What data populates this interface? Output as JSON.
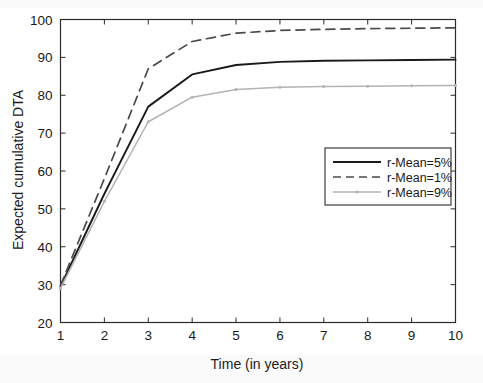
{
  "chart_data": {
    "type": "line",
    "title": "",
    "xlabel": "Time (in years)",
    "ylabel": "Expected cumulative DTA",
    "x": [
      1,
      2,
      3,
      4,
      5,
      6,
      7,
      8,
      9,
      10
    ],
    "xlim": [
      1,
      10
    ],
    "ylim": [
      20,
      100
    ],
    "xticks": [
      "1",
      "2",
      "3",
      "4",
      "5",
      "6",
      "7",
      "8",
      "9",
      "10"
    ],
    "yticks": [
      "20",
      "30",
      "40",
      "50",
      "60",
      "70",
      "80",
      "90",
      "100"
    ],
    "grid": false,
    "legend_position": "center-right",
    "series": [
      {
        "name": "r-Mean=5%",
        "style": "solid",
        "color": "#1a1a1a",
        "width": 1.9,
        "marker": "none",
        "values": [
          29.5,
          54.0,
          77.0,
          85.5,
          88.0,
          88.8,
          89.1,
          89.2,
          89.3,
          89.4
        ]
      },
      {
        "name": "r-Mean=1%",
        "style": "dashed",
        "color": "#4a4a4a",
        "width": 1.7,
        "marker": "none",
        "values": [
          29.8,
          58.0,
          87.0,
          94.2,
          96.4,
          97.1,
          97.4,
          97.6,
          97.7,
          97.8
        ]
      },
      {
        "name": "r-Mean=9%",
        "style": "solid",
        "color": "#b3b3b3",
        "width": 1.5,
        "marker": "dot",
        "values": [
          29.0,
          52.0,
          73.0,
          79.5,
          81.5,
          82.1,
          82.3,
          82.4,
          82.5,
          82.6
        ]
      }
    ]
  },
  "axes": {
    "x_axis_label": "Time (in years)",
    "y_axis_label": "Expected cumulative DTA"
  },
  "legend": {
    "entries": [
      {
        "label": "r-Mean=5%"
      },
      {
        "label": "r-Mean=1%"
      },
      {
        "label": "r-Mean=9%"
      }
    ]
  },
  "colors": {
    "series_1": "#1a1a1a",
    "series_2": "#4a4a4a",
    "series_3": "#b3b3b3",
    "axis": "#2b2b2b",
    "background": "#ffffff"
  }
}
